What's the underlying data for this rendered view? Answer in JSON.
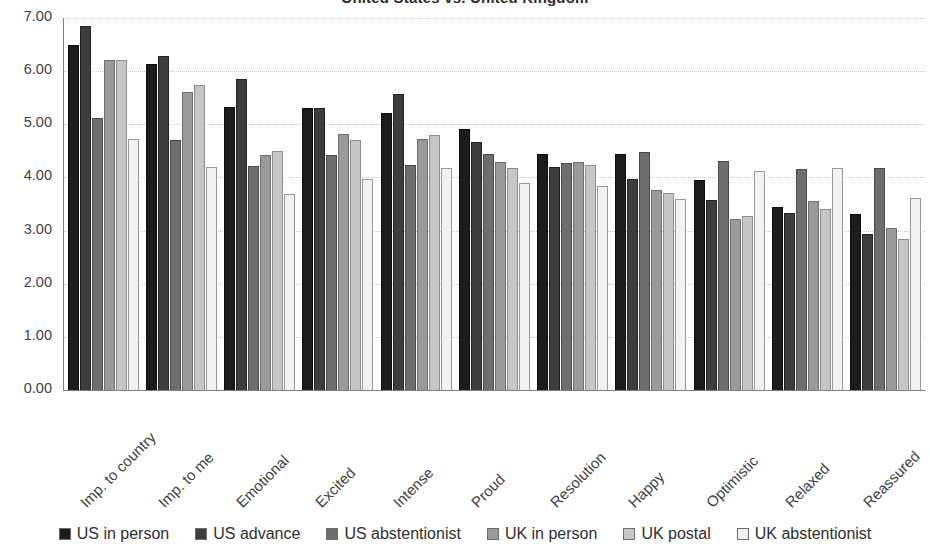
{
  "chart_data": {
    "type": "bar",
    "title": "United States vs. United Kingdom",
    "xlabel": "",
    "ylabel": "",
    "ylim": [
      0,
      7
    ],
    "yticks": [
      "0.00",
      "1.00",
      "2.00",
      "3.00",
      "4.00",
      "5.00",
      "6.00",
      "7.00"
    ],
    "grid": true,
    "legend_position": "bottom",
    "categories": [
      "Imp. to country",
      "Imp. to me",
      "Emotional",
      "Excited",
      "Intense",
      "Proud",
      "Resolution",
      "Happy",
      "Optimistic",
      "Relaxed",
      "Reassured"
    ],
    "series": [
      {
        "name": "US in person",
        "color": "#1c1c1c",
        "values": [
          6.49,
          6.14,
          5.33,
          5.3,
          5.21,
          4.91,
          4.45,
          4.45,
          3.95,
          3.44,
          3.32
        ]
      },
      {
        "name": "US advance",
        "color": "#3d3d3d",
        "values": [
          6.85,
          6.28,
          5.85,
          5.31,
          5.57,
          4.66,
          4.2,
          3.98,
          3.57,
          3.33,
          2.93
        ]
      },
      {
        "name": "US abstentionist",
        "color": "#6e6e6e",
        "values": [
          5.11,
          4.7,
          4.22,
          4.43,
          4.24,
          4.44,
          4.27,
          4.47,
          4.31,
          4.15,
          4.18
        ]
      },
      {
        "name": "UK in person",
        "color": "#9a9a9a",
        "values": [
          6.21,
          5.6,
          4.43,
          4.82,
          4.73,
          4.3,
          4.3,
          3.77,
          3.21,
          3.55,
          3.04
        ]
      },
      {
        "name": "UK postal",
        "color": "#c6c6c6",
        "values": [
          6.21,
          5.74,
          4.49,
          4.7,
          4.79,
          4.18,
          4.23,
          3.71,
          3.28,
          3.4,
          2.85
        ]
      },
      {
        "name": "UK abstentionist",
        "color": "#f2f2f2",
        "values": [
          4.73,
          4.19,
          3.69,
          3.97,
          4.18,
          3.89,
          3.84,
          3.6,
          4.12,
          4.18,
          3.61
        ]
      }
    ]
  }
}
